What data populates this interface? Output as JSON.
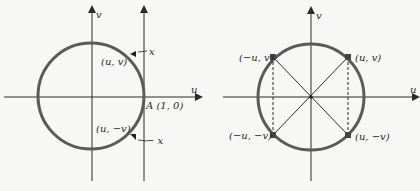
{
  "figure_left": {
    "axis_u_label": "u",
    "axis_v_label": "v",
    "point_upper_label": "(u, v)",
    "point_lower_label": "(u, −v)",
    "point_A_label": "A (1, 0)",
    "marker_upper_label": "x",
    "marker_lower_label": "− x"
  },
  "figure_right": {
    "axis_u_label": "u",
    "axis_v_label": "v",
    "points": [
      {
        "label": "(−u, v)"
      },
      {
        "label": "(u, v)"
      },
      {
        "label": "(−u, −v)"
      },
      {
        "label": "(u, −v)"
      }
    ]
  },
  "colors": {
    "circle": "#5a5a5a",
    "axes": "#2a2a2a",
    "background": "#f7f7f5"
  }
}
